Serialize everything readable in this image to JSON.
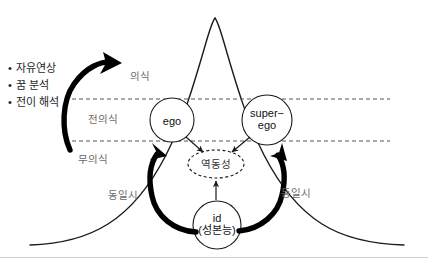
{
  "diagram": {
    "type": "bell-curve-psyche-diagram",
    "colors": {
      "curve": "#1a1a1a",
      "dashed_line": "#555555",
      "node_stroke": "#1a1a1a",
      "thick_arrow": "#000000",
      "thin_arrow": "#1a1a1a",
      "layer_label": "#6b6b6b",
      "bullet_text": "#1f1f1f",
      "divider": "#cfcfcf",
      "background": "#ffffff"
    },
    "techniques": {
      "items": [
        {
          "bullet": "•",
          "label": "자유연상"
        },
        {
          "bullet": "•",
          "label": "꿈 분석"
        },
        {
          "bullet": "•",
          "label": "전이 해석"
        }
      ]
    },
    "layers": [
      {
        "id": "conscious",
        "label": "의식",
        "x": 146,
        "y": 76
      },
      {
        "id": "preconscious",
        "label": "전의식",
        "x": 104,
        "y": 119
      },
      {
        "id": "unconscious",
        "label": "무의식",
        "x": 96,
        "y": 160
      }
    ],
    "nodes": [
      {
        "id": "ego",
        "label": "ego",
        "shape": "circle",
        "cx": 172,
        "cy": 120,
        "r": 22,
        "dashed": false
      },
      {
        "id": "superego",
        "label_line1": "super−",
        "label_line2": "ego",
        "shape": "circle",
        "cx": 267,
        "cy": 120,
        "r": 25,
        "dashed": false
      },
      {
        "id": "dynamics",
        "label": "역동성",
        "shape": "ellipse",
        "cx": 216,
        "cy": 164,
        "rx": 28,
        "ry": 14,
        "dashed": true
      },
      {
        "id": "id",
        "label_line1": "id",
        "label_line2": "(성본능)",
        "shape": "circle",
        "cx": 217,
        "cy": 225,
        "r": 24,
        "dashed": false
      }
    ],
    "edge_labels": [
      {
        "id": "identification-left",
        "label": "동일시",
        "x": 122,
        "y": 195
      },
      {
        "id": "identification-right",
        "label": "동일시",
        "x": 292,
        "y": 193
      }
    ],
    "arrows": [
      {
        "id": "therapy-arrow",
        "style": "thick-curved",
        "from": "techniques",
        "to": "conscious"
      },
      {
        "id": "ego-to-dynamics",
        "style": "thin",
        "from": "ego",
        "to": "dynamics"
      },
      {
        "id": "superego-to-dynamics",
        "style": "thin",
        "from": "superego",
        "to": "dynamics"
      },
      {
        "id": "id-to-dynamics",
        "style": "thin",
        "from": "id",
        "to": "dynamics"
      },
      {
        "id": "ego-to-id",
        "style": "thick-curved",
        "from": "ego",
        "to": "id"
      },
      {
        "id": "id-to-superego",
        "style": "thick-curved",
        "from": "id",
        "to": "superego"
      }
    ]
  }
}
